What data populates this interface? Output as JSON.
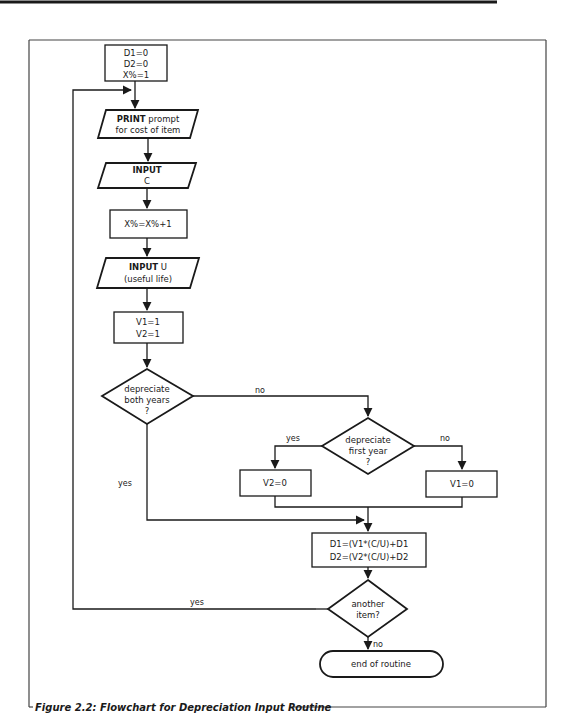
{
  "figure": {
    "caption": "Figure 2.2: Flowchart for Depreciation Input Routine",
    "line_color": "#1a1a1a",
    "background": "#ffffff"
  },
  "nodes": {
    "init": {
      "type": "process",
      "lines": [
        "D1=0",
        "D2=0",
        "X%=1"
      ]
    },
    "print_prompt": {
      "type": "io",
      "keyword": "PRINT",
      "line1_rest": " prompt",
      "line2": "for cost of item"
    },
    "input_c": {
      "type": "io",
      "keyword": "INPUT",
      "line2": "C"
    },
    "increment": {
      "type": "process",
      "lines": [
        "X%=X%+1"
      ]
    },
    "input_u": {
      "type": "io",
      "keyword": "INPUT",
      "line1_rest": " U",
      "line2": "(useful life)"
    },
    "set_v": {
      "type": "process",
      "lines": [
        "V1=1",
        "V2=1"
      ]
    },
    "decision_both": {
      "type": "decision",
      "lines": [
        "depreciate",
        "both years",
        "?"
      ]
    },
    "decision_first": {
      "type": "decision",
      "lines": [
        "depreciate",
        "first year",
        "?"
      ]
    },
    "set_v2_zero": {
      "type": "process",
      "lines": [
        "V2=0"
      ]
    },
    "set_v1_zero": {
      "type": "process",
      "lines": [
        "V1=0"
      ]
    },
    "accumulate": {
      "type": "process",
      "lines": [
        "D1=(V1*(C/U)+D1",
        "D2=(V2*(C/U)+D2"
      ]
    },
    "decision_another": {
      "type": "decision",
      "lines": [
        "another",
        "item?"
      ]
    },
    "end": {
      "type": "terminator",
      "lines": [
        "end of routine"
      ]
    }
  },
  "edge_labels": {
    "both_no": "no",
    "both_yes": "yes",
    "first_yes": "yes",
    "first_no": "no",
    "another_yes": "yes",
    "another_no": "no"
  }
}
